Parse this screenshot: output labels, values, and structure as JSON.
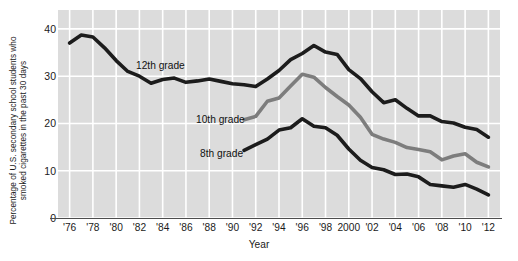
{
  "chart_data": {
    "type": "line",
    "title": "",
    "subtitle": "",
    "xlabel": "Year",
    "ylabel": "Percentage of U.S. secondary school students who\nsmoked cigarettes in the past 30 days",
    "ylim": [
      0,
      44
    ],
    "yticks": [
      0,
      10,
      20,
      30,
      40
    ],
    "ytick_labels": [
      "0",
      "10",
      "20",
      "30",
      "40"
    ],
    "xlim": [
      1975,
      2013
    ],
    "xticks": [
      1976,
      1978,
      1980,
      1982,
      1984,
      1986,
      1988,
      1990,
      1992,
      1994,
      1996,
      1998,
      2000,
      2002,
      2004,
      2006,
      2008,
      2010,
      2012
    ],
    "xtick_labels": [
      "'76",
      "'78",
      "'80",
      "'82",
      "'84",
      "'86",
      "'88",
      "'90",
      "'92",
      "'94",
      "'96",
      "'98",
      "2000",
      "'02",
      "'04",
      "'06",
      "'08",
      "'10",
      "'12"
    ],
    "grid": true,
    "grid_color": "#ffffff",
    "panel_background": "#dcdcdc",
    "legend_position": "inline-annotations",
    "series": [
      {
        "name": "12th grade",
        "color": "#1c1c1c",
        "x": [
          1976,
          1977,
          1978,
          1979,
          1980,
          1981,
          1982,
          1983,
          1984,
          1985,
          1986,
          1987,
          1988,
          1989,
          1990,
          1991,
          1992,
          1993,
          1994,
          1995,
          1996,
          1997,
          1998,
          1999,
          2000,
          2001,
          2002,
          2003,
          2004,
          2005,
          2006,
          2007,
          2008,
          2009,
          2010,
          2011,
          2012
        ],
        "values": [
          37.0,
          38.7,
          38.3,
          36.0,
          33.3,
          31.0,
          30.0,
          28.5,
          29.3,
          29.6,
          28.7,
          29.0,
          29.4,
          28.9,
          28.4,
          28.2,
          27.8,
          29.4,
          31.2,
          33.5,
          34.8,
          36.5,
          35.1,
          34.6,
          31.4,
          29.5,
          26.7,
          24.4,
          25.0,
          23.2,
          21.6,
          21.6,
          20.4,
          20.1,
          19.2,
          18.7,
          17.1
        ]
      },
      {
        "name": "10th grade",
        "color": "#7d7d7d",
        "x": [
          1991,
          1992,
          1993,
          1994,
          1995,
          1996,
          1997,
          1998,
          1999,
          2000,
          2001,
          2002,
          2003,
          2004,
          2005,
          2006,
          2007,
          2008,
          2009,
          2010,
          2011,
          2012
        ],
        "values": [
          20.8,
          21.5,
          24.7,
          25.4,
          27.9,
          30.4,
          29.8,
          27.6,
          25.7,
          23.9,
          21.3,
          17.7,
          16.7,
          16.0,
          14.9,
          14.5,
          14.0,
          12.3,
          13.1,
          13.6,
          11.8,
          10.8
        ]
      },
      {
        "name": "8th grade",
        "color": "#1c1c1c",
        "x": [
          1991,
          1992,
          1993,
          1994,
          1995,
          1996,
          1997,
          1998,
          1999,
          2000,
          2001,
          2002,
          2003,
          2004,
          2005,
          2006,
          2007,
          2008,
          2009,
          2010,
          2011,
          2012
        ],
        "values": [
          14.3,
          15.5,
          16.7,
          18.6,
          19.1,
          21.0,
          19.4,
          19.1,
          17.5,
          14.6,
          12.2,
          10.7,
          10.2,
          9.2,
          9.3,
          8.7,
          7.1,
          6.8,
          6.5,
          7.1,
          6.1,
          4.9
        ]
      }
    ],
    "annotations": [
      {
        "text": "12th grade",
        "x": 1983.5,
        "y": 32.0
      },
      {
        "text": "10th grade",
        "x": 1989.5,
        "y": 20.8
      },
      {
        "text": "8th grade",
        "x": 1990.0,
        "y": 14.3
      }
    ]
  }
}
